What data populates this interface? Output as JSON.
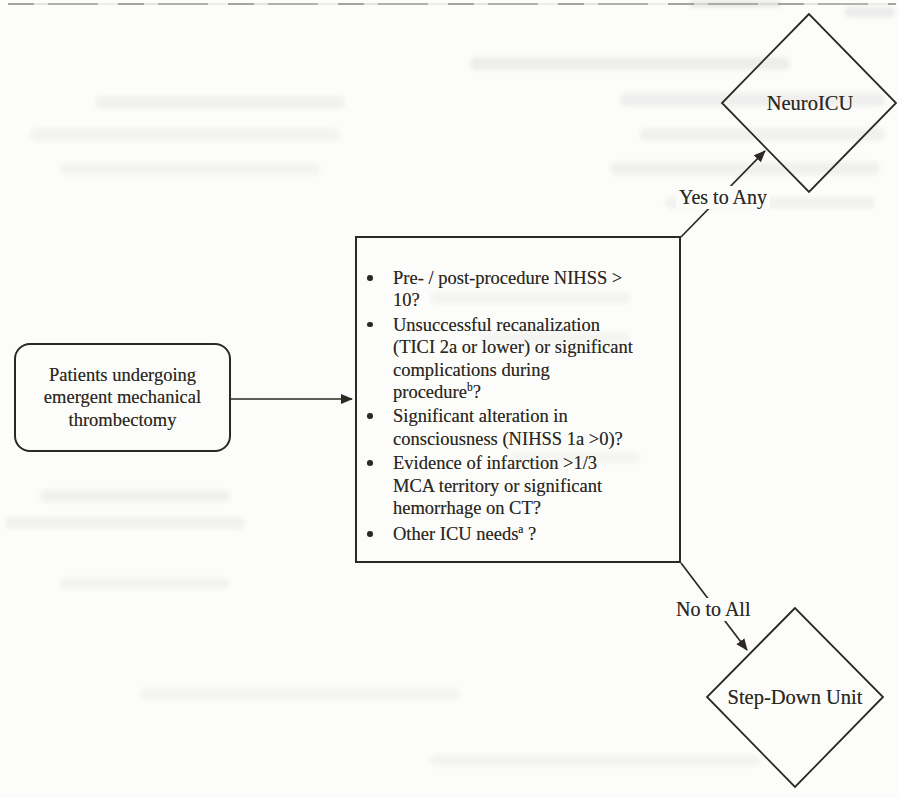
{
  "palette": {
    "paper": "#fcfcfa",
    "ink": "#2c2923"
  },
  "flowchart": {
    "start_node": {
      "label": "Patients undergoing\nemergent mechanical\nthrombectomy"
    },
    "criteria_node": {
      "items": [
        {
          "lines": [
            [
              "Pre- / post-procedure NIHSS >"
            ],
            [
              "10?"
            ]
          ]
        },
        {
          "lines": [
            [
              "Unsuccessful recanalization"
            ],
            [
              "(TICI 2a or lower) or significant"
            ],
            [
              "complications during"
            ],
            [
              "procedure",
              {
                "sup": "b"
              },
              "?"
            ]
          ]
        },
        {
          "lines": [
            [
              "Significant alteration in"
            ],
            [
              "consciousness (NIHSS 1a >0)?"
            ]
          ]
        },
        {
          "lines": [
            [
              "Evidence of infarction >1/3"
            ],
            [
              "MCA territory or significant"
            ],
            [
              "hemorrhage on CT?"
            ]
          ]
        },
        {
          "lines": [
            [
              "Other ICU needs",
              {
                "sup": "a"
              },
              " ?"
            ]
          ]
        }
      ]
    },
    "edge_labels": {
      "yes": "Yes to Any",
      "no": "No to All"
    },
    "outcome_nodes": {
      "neuro_icu": "NeuroICU",
      "step_down": "Step-Down Unit"
    }
  }
}
